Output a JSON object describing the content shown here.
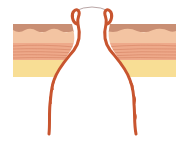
{
  "diagram": {
    "type": "anatomical-cross-section",
    "layers": [
      {
        "name": "epidermis",
        "color": "#c98f74"
      },
      {
        "name": "dermis-upper",
        "color": "#f3c4a2"
      },
      {
        "name": "dermis-lower",
        "color": "#eea98a",
        "stripe_color": "#d98868"
      },
      {
        "name": "subcutaneous-fat",
        "color": "#f8de95"
      }
    ],
    "tract": {
      "wall_color": "#c8552f",
      "opening_arc_color": "#8a6a6a"
    }
  }
}
